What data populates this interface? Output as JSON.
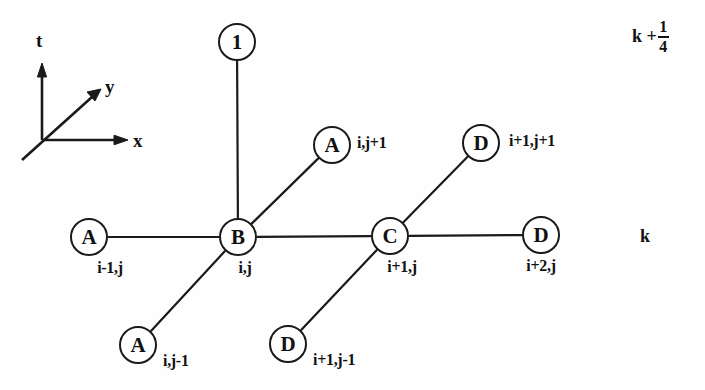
{
  "diagram": {
    "axes": {
      "t_label": "t",
      "y_label": "y",
      "x_label": "x"
    },
    "time_levels": {
      "upper_base": "k +",
      "upper_numerator": "1",
      "upper_denominator": "4",
      "lower": "k"
    },
    "nodes": [
      {
        "id": "top-one",
        "letter": "1",
        "index_label": "",
        "cx": 237,
        "cy": 42,
        "r": 19
      },
      {
        "id": "a-i-j-plus-1",
        "letter": "A",
        "index_label": "i,j+1",
        "cx": 332,
        "cy": 145,
        "r": 19
      },
      {
        "id": "d-i1-j-plus-1",
        "letter": "D",
        "index_label": "i+1,j+1",
        "cx": 481,
        "cy": 143,
        "r": 19
      },
      {
        "id": "a-i-minus-1-j",
        "letter": "A",
        "index_label": "i-1,j",
        "cx": 89,
        "cy": 237,
        "r": 19
      },
      {
        "id": "b-i-j",
        "letter": "B",
        "index_label": "i,j",
        "cx": 238,
        "cy": 237,
        "r": 19
      },
      {
        "id": "c-i-plus-1-j",
        "letter": "C",
        "index_label": "i+1,j",
        "cx": 390,
        "cy": 236,
        "r": 19
      },
      {
        "id": "d-i-plus-2-j",
        "letter": "D",
        "index_label": "i+2,j",
        "cx": 541,
        "cy": 235,
        "r": 19
      },
      {
        "id": "a-i-j-minus-1",
        "letter": "A",
        "index_label": "i,j-1",
        "cx": 138,
        "cy": 345,
        "r": 19
      },
      {
        "id": "d-i1-j-minus-1",
        "letter": "D",
        "index_label": "i+1,j-1",
        "cx": 288,
        "cy": 344,
        "r": 19
      }
    ],
    "edges": [
      {
        "from": "b-i-j",
        "to": "top-one"
      },
      {
        "from": "b-i-j",
        "to": "a-i-j-plus-1"
      },
      {
        "from": "b-i-j",
        "to": "a-i-minus-1-j"
      },
      {
        "from": "b-i-j",
        "to": "c-i-plus-1-j"
      },
      {
        "from": "b-i-j",
        "to": "a-i-j-minus-1"
      },
      {
        "from": "c-i-plus-1-j",
        "to": "d-i1-j-plus-1"
      },
      {
        "from": "c-i-plus-1-j",
        "to": "d-i-plus-2-j"
      },
      {
        "from": "c-i-plus-1-j",
        "to": "d-i1-j-minus-1"
      }
    ],
    "colors": {
      "ink": "#111111",
      "background": "#fefefe"
    }
  }
}
